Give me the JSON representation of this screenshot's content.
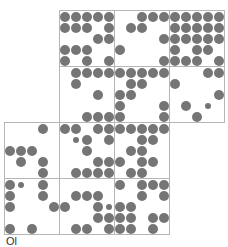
{
  "diagram": {
    "type": "dot-grid-puzzle",
    "grid_origin": [
      4,
      10
    ],
    "cell_size": [
      55,
      56
    ],
    "dot_pitch": 11,
    "dot_offset": [
      6,
      7
    ],
    "dot_radius": 5,
    "dot_small_radius": 3,
    "colors": {
      "dot": "#757575",
      "border": "#b5b5b5",
      "background": "#ffffff"
    },
    "cells": [
      {
        "row": 0,
        "col": 1,
        "dots": [
          [
            0,
            0
          ],
          [
            1,
            0
          ],
          [
            2,
            0
          ],
          [
            3,
            0
          ],
          [
            4,
            0
          ],
          [
            0,
            1
          ],
          [
            1,
            1
          ],
          [
            2,
            1
          ],
          [
            4,
            1
          ],
          [
            3,
            2
          ],
          [
            4,
            2
          ],
          [
            0,
            3
          ],
          [
            1,
            3
          ],
          [
            2,
            3
          ],
          [
            0,
            4
          ],
          [
            2,
            4
          ],
          [
            4,
            4
          ]
        ]
      },
      {
        "row": 0,
        "col": 2,
        "dots": [
          [
            2,
            0
          ],
          [
            3,
            0
          ],
          [
            4,
            0
          ],
          [
            1,
            1
          ],
          [
            2,
            1
          ],
          [
            4,
            2
          ],
          [
            0,
            3
          ],
          [
            4,
            4
          ]
        ]
      },
      {
        "row": 0,
        "col": 3,
        "dots": [
          [
            0,
            0
          ],
          [
            1,
            0
          ],
          [
            2,
            0
          ],
          [
            3,
            0
          ],
          [
            4,
            0
          ],
          [
            0,
            1
          ],
          [
            1,
            1
          ],
          [
            2,
            1
          ],
          [
            3,
            1
          ],
          [
            4,
            1
          ],
          [
            0,
            2
          ],
          [
            1,
            2
          ],
          [
            2,
            2
          ],
          [
            3,
            2
          ],
          [
            4,
            2
          ],
          [
            0,
            3
          ],
          [
            2,
            3
          ],
          [
            3,
            3
          ],
          [
            0,
            4
          ],
          [
            1,
            4
          ],
          [
            2,
            4
          ],
          [
            4,
            4
          ]
        ]
      },
      {
        "row": 1,
        "col": 1,
        "dots": [
          [
            1,
            0
          ],
          [
            2,
            0
          ],
          [
            3,
            0
          ],
          [
            4,
            0
          ],
          [
            1,
            1
          ],
          [
            3,
            2
          ],
          [
            2,
            4
          ],
          [
            3,
            4
          ],
          [
            4,
            4
          ]
        ]
      },
      {
        "row": 1,
        "col": 2,
        "dots": [
          [
            0,
            0
          ],
          [
            1,
            0
          ],
          [
            2,
            0
          ],
          [
            3,
            0
          ],
          [
            4,
            0
          ],
          [
            1,
            1
          ],
          [
            2,
            1
          ],
          [
            0,
            2
          ],
          [
            1,
            2
          ],
          [
            0,
            3
          ],
          [
            4,
            3
          ],
          [
            0,
            4
          ],
          [
            4,
            4
          ]
        ]
      },
      {
        "row": 1,
        "col": 3,
        "dots": [
          [
            3,
            0
          ],
          [
            4,
            0
          ],
          [
            0,
            1
          ],
          [
            4,
            2
          ],
          [
            1,
            3
          ],
          [
            3,
            3,
            "s"
          ],
          [
            2,
            4
          ]
        ]
      },
      {
        "row": 2,
        "col": 0,
        "dots": [
          [
            3,
            0
          ],
          [
            0,
            2
          ],
          [
            1,
            2
          ],
          [
            2,
            2
          ],
          [
            1,
            3
          ],
          [
            3,
            3
          ],
          [
            3,
            4
          ]
        ]
      },
      {
        "row": 2,
        "col": 1,
        "dots": [
          [
            0,
            0
          ],
          [
            1,
            0
          ],
          [
            3,
            0
          ],
          [
            4,
            0
          ],
          [
            1,
            1,
            "s"
          ],
          [
            2,
            1
          ],
          [
            4,
            1
          ],
          [
            2,
            2
          ],
          [
            3,
            3
          ],
          [
            4,
            3
          ],
          [
            1,
            4
          ],
          [
            2,
            4
          ],
          [
            3,
            4
          ],
          [
            4,
            4
          ]
        ]
      },
      {
        "row": 2,
        "col": 2,
        "dots": [
          [
            0,
            0
          ],
          [
            1,
            0
          ],
          [
            2,
            0
          ],
          [
            3,
            0
          ],
          [
            4,
            0
          ],
          [
            2,
            1
          ],
          [
            3,
            1
          ],
          [
            1,
            2
          ],
          [
            2,
            2
          ],
          [
            0,
            3
          ],
          [
            2,
            3
          ],
          [
            3,
            3
          ],
          [
            1,
            4
          ],
          [
            2,
            4
          ]
        ]
      },
      {
        "row": 3,
        "col": 0,
        "dots": [
          [
            0,
            0
          ],
          [
            1,
            0,
            "s"
          ],
          [
            3,
            0
          ],
          [
            0,
            1
          ],
          [
            3,
            1
          ],
          [
            0,
            2
          ],
          [
            4,
            2
          ],
          [
            0,
            4
          ],
          [
            2,
            4
          ]
        ]
      },
      {
        "row": 3,
        "col": 1,
        "dots": [
          [
            1,
            1
          ],
          [
            2,
            1
          ],
          [
            3,
            1
          ],
          [
            0,
            2
          ],
          [
            3,
            2
          ],
          [
            4,
            2,
            "s"
          ],
          [
            3,
            3
          ],
          [
            4,
            3
          ],
          [
            1,
            4
          ],
          [
            2,
            4
          ],
          [
            4,
            4
          ]
        ]
      },
      {
        "row": 3,
        "col": 2,
        "dots": [
          [
            0,
            0
          ],
          [
            2,
            0
          ],
          [
            3,
            0
          ],
          [
            4,
            0
          ],
          [
            2,
            1
          ],
          [
            4,
            1
          ],
          [
            0,
            2
          ],
          [
            1,
            2
          ],
          [
            0,
            3
          ],
          [
            1,
            3
          ],
          [
            3,
            3
          ],
          [
            4,
            3
          ],
          [
            0,
            4
          ],
          [
            1,
            4
          ],
          [
            3,
            4
          ]
        ]
      }
    ]
  },
  "caption": "Ol"
}
